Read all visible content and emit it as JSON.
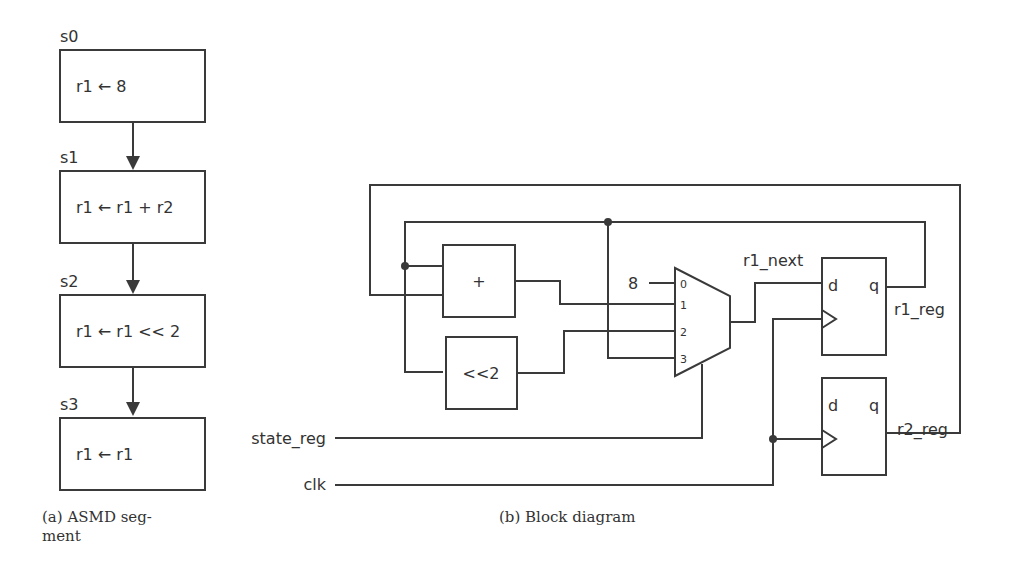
{
  "asmd": {
    "states": [
      {
        "name": "s0",
        "action": "r1 ← 8"
      },
      {
        "name": "s1",
        "action": "r1 ← r1 + r2"
      },
      {
        "name": "s2",
        "action": "r1 ← r1 << 2"
      },
      {
        "name": "s3",
        "action": "r1 ← r1"
      }
    ],
    "caption_line1": "(a)  ASMD    seg-",
    "caption_line2": "ment"
  },
  "block": {
    "adder_label": "+",
    "shifter_label": "<<2",
    "mux_const": "8",
    "mux_inputs": [
      "0",
      "1",
      "2",
      "3"
    ],
    "mux_out_label": "r1_next",
    "reg1": {
      "d": "d",
      "q": "q",
      "name": "r1_reg"
    },
    "reg2": {
      "d": "d",
      "q": "q",
      "name": "r2_reg"
    },
    "state_label": "state_reg",
    "clk_label": "clk",
    "caption": "(b) Block diagram"
  }
}
